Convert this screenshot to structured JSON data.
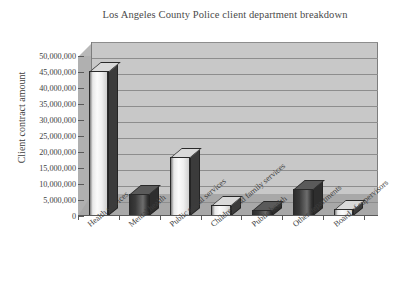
{
  "chart_data": {
    "type": "bar",
    "title": "Los Angeles County Police client department breakdown",
    "xlabel": "",
    "ylabel": "Client contract amount",
    "categories": [
      "Health services",
      "Mental health",
      "Public social services",
      "Children and family services",
      "Public health",
      "Other departments",
      "Board of supervisors"
    ],
    "values": [
      45300000,
      6800000,
      18500000,
      3300000,
      2000000,
      8400000,
      2200000
    ],
    "ylim": [
      0,
      50000000
    ],
    "ytick_labels": [
      "50,000,000",
      "45,000,000",
      "40,000,000",
      "35,000,000",
      "30,000,000",
      "25,000,000",
      "20,000,000",
      "15,000,000",
      "10,000,000",
      "5,000,000",
      "0"
    ],
    "ytick_values": [
      50000000,
      45000000,
      40000000,
      35000000,
      30000000,
      25000000,
      20000000,
      15000000,
      10000000,
      5000000,
      0
    ],
    "grid": true,
    "legend": "none",
    "style": "3d",
    "bar_shades": [
      "light",
      "dark",
      "light",
      "light",
      "dark",
      "dark",
      "light"
    ],
    "colors": {
      "bar_light": "#f0f0f0",
      "bar_dark": "#3a3a3a",
      "bar_outline": "#2a2a2a",
      "wall_back": "#c8c8c8",
      "wall_left": "#b0b0b0",
      "floor": "#a8a8a8",
      "gridline": "#8d8d8d",
      "text": "#3e3e3e",
      "background": "#ffffff"
    }
  }
}
